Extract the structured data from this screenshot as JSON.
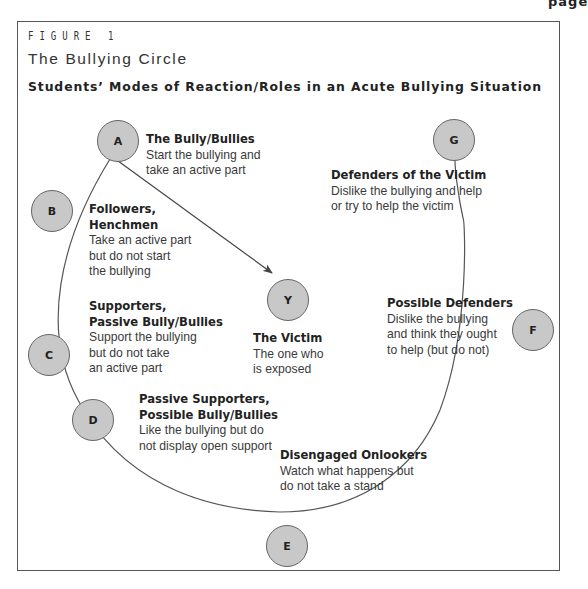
{
  "page_corner_text": "page",
  "figure": {
    "label": "FIGURE 1",
    "title": "The Bullying Circle",
    "subtitle": "Students’ Modes of Reaction/Roles in an Acute Bullying Situation"
  },
  "colors": {
    "node_fill": "#c8c8c8",
    "node_stroke": "#666666",
    "line": "#555555",
    "frame": "#555555"
  },
  "nodes": [
    {
      "letter": "A",
      "title": "The Bully/Bullies",
      "description": "Start the bullying and\ntake an active part"
    },
    {
      "letter": "B",
      "title": "Followers,\nHenchmen",
      "description": "Take an active part\nbut do not start\nthe bullying"
    },
    {
      "letter": "C",
      "title": "Supporters,\nPassive Bully/Bullies",
      "description": "Support the bullying\nbut do not take\nan active part"
    },
    {
      "letter": "D",
      "title": "Passive Supporters,\nPossible Bully/Bullies",
      "description": "Like the bullying but do\nnot display open support"
    },
    {
      "letter": "E",
      "title": "Disengaged Onlookers",
      "description": "Watch what happens but\ndo not take a stand"
    },
    {
      "letter": "F",
      "title": "Possible Defenders",
      "description": "Dislike the bullying\nand think they ought\nto help (but do not)"
    },
    {
      "letter": "G",
      "title": "Defenders of the Victim",
      "description": "Dislike the bullying and help\nor try to help the victim"
    },
    {
      "letter": "Y",
      "title": "The Victim",
      "description": "The one who\nis exposed"
    }
  ],
  "arrow": {
    "from": "A",
    "to": "Y"
  }
}
